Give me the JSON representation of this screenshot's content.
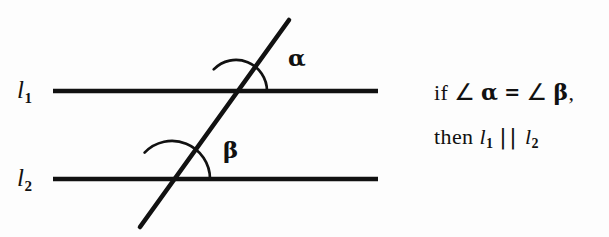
{
  "figure": {
    "background_color": "#fdfdfd",
    "stroke_color": "#111111",
    "lines": [
      {
        "name": "l1",
        "label": "l",
        "subscript": "1",
        "x1": 53,
        "y1": 91,
        "x2": 378,
        "y2": 91,
        "width": 4.5
      },
      {
        "name": "l2",
        "label": "l",
        "subscript": "2",
        "x1": 53,
        "y1": 179,
        "x2": 378,
        "y2": 179,
        "width": 4.5
      }
    ],
    "transversal": {
      "name": "transversal",
      "x1": 140,
      "y1": 227,
      "x2": 289,
      "y2": 20,
      "width": 4.5
    },
    "intersections": [
      {
        "name": "intersection-l1",
        "x": 236,
        "y": 91
      },
      {
        "name": "intersection-l2",
        "x": 172,
        "y": 179
      }
    ],
    "angles": [
      {
        "name": "alpha",
        "label": "α",
        "vertex_x": 236,
        "vertex_y": 91,
        "radius": 31,
        "arc_width": 2.6,
        "label_x": 288,
        "label_y": 46
      },
      {
        "name": "beta",
        "label": "β",
        "vertex_x": 172,
        "vertex_y": 179,
        "radius": 38,
        "arc_width": 2.6,
        "label_x": 223,
        "label_y": 138
      }
    ]
  },
  "statement": {
    "line1": {
      "if_word": "if",
      "angle_symbol_1": "∠",
      "alpha": "α",
      "equals": "=",
      "angle_symbol_2": "∠",
      "beta": "β",
      "comma": ","
    },
    "line2": {
      "then_word": "then",
      "l_first": "l",
      "l_first_sub": "1",
      "parallel_symbol": "||",
      "l_second": "l",
      "l_second_sub": "2"
    }
  }
}
